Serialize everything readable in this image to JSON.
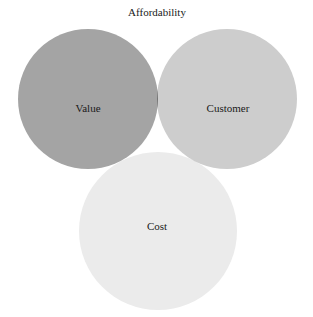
{
  "diagram": {
    "type": "venn",
    "title": "Affordability",
    "sets": [
      {
        "id": "value",
        "label": "Value",
        "color": "#a4a4a4"
      },
      {
        "id": "customer",
        "label": "Customer",
        "color": "#cdcdcd"
      },
      {
        "id": "cost",
        "label": "Cost",
        "color": "#ebebeb"
      }
    ],
    "intersection": {
      "label": "Aim",
      "color": "#4a4a4a"
    },
    "background": "#ffffff"
  }
}
